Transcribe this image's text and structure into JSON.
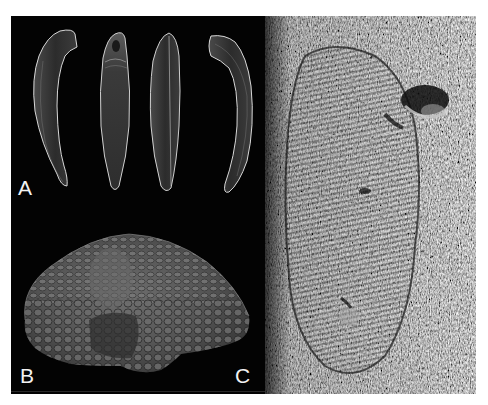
{
  "figure": {
    "background": "#000000",
    "panels": [
      {
        "id": "A",
        "label": "A",
        "content": "Four views of a curved elongate tooth-like element (SEM)",
        "specimen_count": 4
      },
      {
        "id": "B",
        "label": "B",
        "content": "Dome-shaped specimen covered in overlapping scale-like tubercles (SEM)"
      },
      {
        "id": "C",
        "label": "C",
        "content": "Elongate oval impression with concentric ridges in rock matrix"
      }
    ]
  }
}
